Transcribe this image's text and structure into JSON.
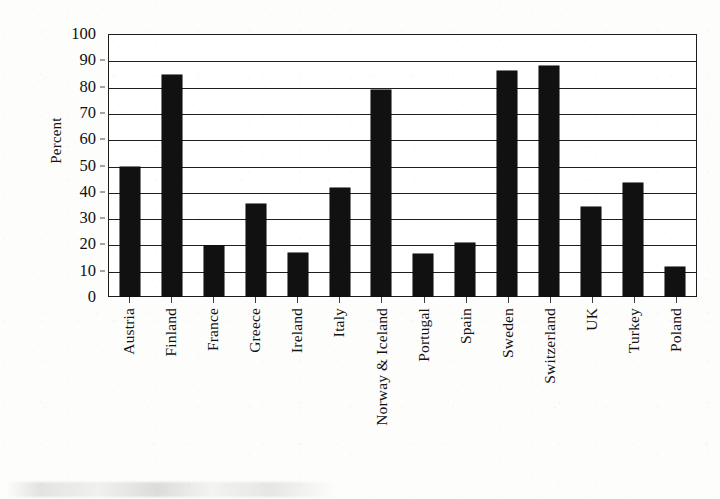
{
  "chart_data": {
    "type": "bar",
    "title": "",
    "subtitle": "",
    "xlabel": "",
    "ylabel": "Percent",
    "ylim": [
      0,
      100
    ],
    "ytick_step": 10,
    "yticks": [
      "0",
      "10",
      "20",
      "30",
      "40",
      "50",
      "60",
      "70",
      "80",
      "90",
      "100"
    ],
    "grid": true,
    "grid_axis": "y",
    "legend": false,
    "legend_position": "none",
    "bar_color": "#111111",
    "axis_color": "#1c1c1c",
    "categories": [
      "Austria",
      "Finland",
      "France",
      "Greece",
      "Ireland",
      "Italy",
      "Norway & Iceland",
      "Portugal",
      "Spain",
      "Sweden",
      "Switzerland",
      "UK",
      "Turkey",
      "Poland"
    ],
    "values": [
      49,
      84,
      19,
      35,
      16.5,
      41,
      78.5,
      16,
      20,
      85.5,
      87.5,
      34,
      43,
      11
    ]
  },
  "figure": {
    "axis_title_y": "Percent"
  }
}
